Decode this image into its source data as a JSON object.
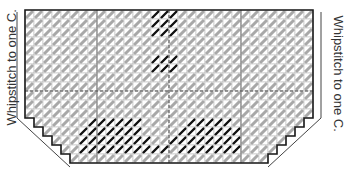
{
  "diagram": {
    "type": "plastic-canvas-stitch-chart",
    "top_note": "(cut off text above grid)",
    "left_label": "Whipstitch to one C.",
    "right_label": "Whipstitch to one C.",
    "grid": {
      "origin_x": 25,
      "origin_y": 10,
      "cell": 9,
      "cols": 32,
      "rows": 17,
      "center_col": 16,
      "center_row": 9,
      "quarter_cols": [
        8,
        24
      ]
    },
    "colors": {
      "background_stitch": "#a8a8a8",
      "grid_line": "#bdbdbd",
      "border": "#1a1a1a",
      "motif_stitch": "#111111",
      "bracket": "#444444"
    },
    "stepped_corner_steps": 5,
    "motifs": [
      {
        "name": "top-block-1",
        "cells": [
          [
            14,
            0
          ],
          [
            15,
            0
          ],
          [
            16,
            0
          ],
          [
            14,
            1
          ],
          [
            15,
            1
          ],
          [
            16,
            1
          ],
          [
            14,
            2
          ],
          [
            15,
            2
          ],
          [
            16,
            2
          ]
        ]
      },
      {
        "name": "top-block-2",
        "cells": [
          [
            14,
            5
          ],
          [
            15,
            5
          ],
          [
            16,
            5
          ],
          [
            14,
            6
          ],
          [
            15,
            6
          ],
          [
            16,
            6
          ]
        ]
      },
      {
        "name": "bottom-mound-left",
        "cells": [
          [
            7,
            12
          ],
          [
            8,
            12
          ],
          [
            9,
            12
          ],
          [
            10,
            12
          ],
          [
            11,
            12
          ],
          [
            12,
            12
          ],
          [
            6,
            13
          ],
          [
            7,
            13
          ],
          [
            8,
            13
          ],
          [
            9,
            13
          ],
          [
            10,
            13
          ],
          [
            11,
            13
          ],
          [
            12,
            13
          ],
          [
            6,
            14
          ],
          [
            7,
            14
          ],
          [
            8,
            14
          ],
          [
            9,
            14
          ],
          [
            10,
            14
          ],
          [
            11,
            14
          ],
          [
            12,
            14
          ],
          [
            13,
            14
          ],
          [
            6,
            15
          ],
          [
            7,
            15
          ],
          [
            8,
            15
          ],
          [
            9,
            15
          ],
          [
            10,
            15
          ],
          [
            11,
            15
          ],
          [
            12,
            15
          ],
          [
            13,
            15
          ],
          [
            14,
            15
          ],
          [
            15,
            15
          ]
        ]
      },
      {
        "name": "bottom-mound-right",
        "cells": [
          [
            18,
            12
          ],
          [
            19,
            12
          ],
          [
            20,
            12
          ],
          [
            21,
            12
          ],
          [
            22,
            12
          ],
          [
            17,
            13
          ],
          [
            18,
            13
          ],
          [
            19,
            13
          ],
          [
            20,
            13
          ],
          [
            21,
            13
          ],
          [
            22,
            13
          ],
          [
            23,
            13
          ],
          [
            16,
            14
          ],
          [
            17,
            14
          ],
          [
            18,
            14
          ],
          [
            19,
            14
          ],
          [
            20,
            14
          ],
          [
            21,
            14
          ],
          [
            22,
            14
          ],
          [
            23,
            14
          ],
          [
            17,
            15
          ],
          [
            18,
            15
          ],
          [
            19,
            15
          ],
          [
            20,
            15
          ],
          [
            21,
            15
          ],
          [
            22,
            15
          ],
          [
            23,
            15
          ]
        ]
      }
    ]
  }
}
